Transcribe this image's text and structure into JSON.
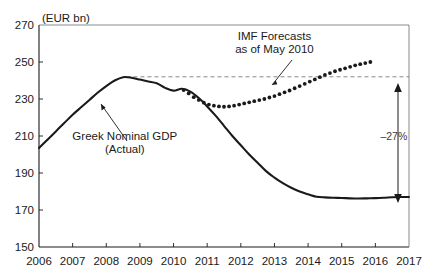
{
  "chart_data": {
    "type": "line",
    "title": "",
    "unit_label": "(EUR bn)",
    "xlabel": "",
    "ylabel": "",
    "xlim": [
      2006,
      2017
    ],
    "ylim": [
      150,
      270
    ],
    "ytick_labels": [
      "270",
      "250",
      "230",
      "210",
      "190",
      "170",
      "150"
    ],
    "yticks": [
      270,
      250,
      230,
      210,
      190,
      170,
      150
    ],
    "xtick_labels": [
      "2006",
      "2007",
      "2008",
      "2009",
      "2010",
      "2011",
      "2012",
      "2013",
      "2014",
      "2015",
      "2016",
      "2017"
    ],
    "xticks": [
      2006,
      2007,
      2008,
      2009,
      2010,
      2011,
      2012,
      2013,
      2014,
      2015,
      2016,
      2017
    ],
    "grid": false,
    "legend_position": "none",
    "series": [
      {
        "name": "Greek Nominal GDP (Actual)",
        "style": "solid",
        "x": [
          2006.0,
          2006.25,
          2006.5,
          2006.75,
          2007.0,
          2007.25,
          2007.5,
          2007.75,
          2008.0,
          2008.25,
          2008.5,
          2008.75,
          2009.0,
          2009.25,
          2009.5,
          2009.75,
          2010.0,
          2010.25,
          2010.5,
          2010.75,
          2011.0,
          2011.25,
          2011.5,
          2011.75,
          2012.0,
          2012.25,
          2012.5,
          2012.75,
          2013.0,
          2013.25,
          2013.5,
          2013.75,
          2014.0,
          2014.25,
          2014.5,
          2014.75,
          2015.0,
          2015.25,
          2015.5,
          2015.75,
          2016.0,
          2016.25,
          2016.5,
          2016.75,
          2017.0
        ],
        "y": [
          203.5,
          208.0,
          212.5,
          217.0,
          221.5,
          225.5,
          229.5,
          233.5,
          237.0,
          240.0,
          241.8,
          241.5,
          240.5,
          239.5,
          238.5,
          236.0,
          234.5,
          235.5,
          234.0,
          230.5,
          226.0,
          221.0,
          215.5,
          210.0,
          205.0,
          200.0,
          195.5,
          191.0,
          187.5,
          184.5,
          182.0,
          180.0,
          178.5,
          177.2,
          176.8,
          176.6,
          176.5,
          176.3,
          176.2,
          176.3,
          176.4,
          176.6,
          176.9,
          177.0,
          177.0
        ]
      },
      {
        "name": "IMF Forecasts as of May 2010",
        "style": "dotted",
        "x": [
          2010.3,
          2010.45,
          2010.6,
          2010.75,
          2010.9,
          2011.05,
          2011.2,
          2011.35,
          2011.5,
          2011.65,
          2011.8,
          2011.95,
          2012.1,
          2012.25,
          2012.4,
          2012.55,
          2012.7,
          2012.85,
          2013.0,
          2013.15,
          2013.3,
          2013.45,
          2013.6,
          2013.75,
          2013.9,
          2014.05,
          2014.2,
          2014.35,
          2014.5,
          2014.65,
          2014.8,
          2014.95,
          2015.1,
          2015.25,
          2015.4,
          2015.55,
          2015.7,
          2015.85
        ],
        "y": [
          234.8,
          233.0,
          231.0,
          229.5,
          228.0,
          227.0,
          226.4,
          226.0,
          225.8,
          226.0,
          226.4,
          227.0,
          227.6,
          228.2,
          228.8,
          229.4,
          230.0,
          230.8,
          231.6,
          232.6,
          233.6,
          234.6,
          235.8,
          237.0,
          238.2,
          239.4,
          240.6,
          241.8,
          243.0,
          244.0,
          245.0,
          245.8,
          246.6,
          247.4,
          248.2,
          248.8,
          249.4,
          250.0
        ]
      }
    ],
    "reference_line": {
      "name": "peak-level-dashed",
      "value": 242,
      "style": "dashed",
      "x_start": 2008.6,
      "x_end": 2017
    },
    "annotations": [
      {
        "name": "imf-forecast-label",
        "text_lines": [
          "IMF Forecasts",
          "as of May 2010"
        ],
        "x": 2013.0,
        "y": 262
      },
      {
        "name": "greek-gdp-label",
        "text_lines": [
          "Greek Nominal GDP",
          "(Actual)"
        ],
        "x": 2008.55,
        "y": 208
      },
      {
        "name": "decline-percent-label",
        "text": "–27%",
        "x": 2016.55,
        "y": 208
      }
    ]
  }
}
